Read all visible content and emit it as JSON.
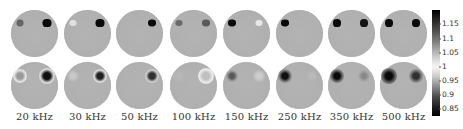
{
  "figure": {
    "frequency_labels": [
      "20 kHz",
      "30 kHz",
      "50 kHz",
      "100 kHz",
      "150 kHz",
      "250 kHz",
      "350 kHz",
      "500 kHz"
    ],
    "columns_x": [
      11,
      64,
      116,
      170,
      223,
      276,
      328,
      380
    ],
    "rows_y": [
      10,
      62
    ],
    "disk_diameter": 47,
    "background_color": "#b0b0b0",
    "top_row_spots": [
      [
        {
          "x": 9,
          "y": 13,
          "w": 7,
          "h": 7,
          "color": "#666666"
        },
        {
          "x": 36,
          "y": 13,
          "w": 9,
          "h": 8,
          "color": "#0a0a0a"
        }
      ],
      [
        {
          "x": 9,
          "y": 13,
          "w": 7,
          "h": 6,
          "color": "#e0e0e0"
        },
        {
          "x": 36,
          "y": 13,
          "w": 9,
          "h": 8,
          "color": "#0a0a0a"
        }
      ],
      [
        {
          "x": 36,
          "y": 13,
          "w": 8,
          "h": 7,
          "color": "#0a0a0a"
        }
      ],
      [
        {
          "x": 9,
          "y": 13,
          "w": 7,
          "h": 6,
          "color": "#6a6a6a"
        },
        {
          "x": 36,
          "y": 13,
          "w": 8,
          "h": 7,
          "color": "#5a5a5a"
        }
      ],
      [
        {
          "x": 9,
          "y": 13,
          "w": 8,
          "h": 7,
          "color": "#0a0a0a"
        },
        {
          "x": 36,
          "y": 13,
          "w": 7,
          "h": 6,
          "color": "#e8e8e8"
        }
      ],
      [
        {
          "x": 9,
          "y": 13,
          "w": 8,
          "h": 7,
          "color": "#0a0a0a"
        }
      ],
      [
        {
          "x": 9,
          "y": 13,
          "w": 8,
          "h": 8,
          "color": "#0a0a0a"
        },
        {
          "x": 36,
          "y": 13,
          "w": 8,
          "h": 8,
          "color": "#151515"
        }
      ],
      [
        {
          "x": 9,
          "y": 13,
          "w": 8,
          "h": 8,
          "color": "#0a0a0a"
        },
        {
          "x": 36,
          "y": 13,
          "w": 8,
          "h": 8,
          "color": "#0a0a0a"
        }
      ]
    ],
    "bottom_row_spots": [
      [
        {
          "x": 9,
          "y": 14,
          "r": 5,
          "center": "#9a9a9a",
          "ring": "#e6e6e6"
        },
        {
          "x": 36,
          "y": 14,
          "r": 6,
          "center": "#101010",
          "ring": "#dcdcdc"
        }
      ],
      [
        {
          "x": 9,
          "y": 14,
          "r": 4,
          "center": "#c8c8c8",
          "ring": "#b8b8b8"
        },
        {
          "x": 36,
          "y": 14,
          "r": 5,
          "center": "#202020",
          "ring": "#e0e0e0"
        }
      ],
      [
        {
          "x": 36,
          "y": 14,
          "r": 5,
          "center": "#303030",
          "ring": "#d0d0d0"
        }
      ],
      [
        {
          "x": 9,
          "y": 14,
          "r": 4,
          "center": "#b8b8b8",
          "ring": "#b4b4b4"
        },
        {
          "x": 36,
          "y": 14,
          "r": 6,
          "center": "#c0c0c0",
          "ring": "#ececec"
        }
      ],
      [
        {
          "x": 9,
          "y": 14,
          "r": 4,
          "center": "#5a5a5a",
          "ring": "#a0a0a0"
        },
        {
          "x": 36,
          "y": 14,
          "r": 4,
          "center": "#cccccc",
          "ring": "#bdbdbd"
        }
      ],
      [
        {
          "x": 9,
          "y": 14,
          "r": 5,
          "center": "#101010",
          "ring": "#8a8a8a"
        },
        {
          "x": 36,
          "y": 14,
          "r": 3,
          "center": "#bababa",
          "ring": "#b4b4b4"
        }
      ],
      [
        {
          "x": 9,
          "y": 14,
          "r": 5,
          "center": "#0a0a0a",
          "ring": "#7a7a7a"
        },
        {
          "x": 36,
          "y": 14,
          "r": 4,
          "center": "#8a8a8a",
          "ring": "#a8a8a8"
        }
      ],
      [
        {
          "x": 9,
          "y": 14,
          "r": 6,
          "center": "#0a0a0a",
          "ring": "#6a6a6a"
        },
        {
          "x": 36,
          "y": 14,
          "r": 5,
          "center": "#303030",
          "ring": "#8a8a8a"
        }
      ]
    ]
  },
  "colorbar": {
    "ticks": [
      {
        "label": "1.15",
        "y": 23
      },
      {
        "label": "1.1",
        "y": 38
      },
      {
        "label": "1.05",
        "y": 52
      },
      {
        "label": "1",
        "y": 66
      },
      {
        "label": "0.95",
        "y": 80
      },
      {
        "label": "0.9",
        "y": 94
      },
      {
        "label": "0.85",
        "y": 108
      }
    ]
  }
}
